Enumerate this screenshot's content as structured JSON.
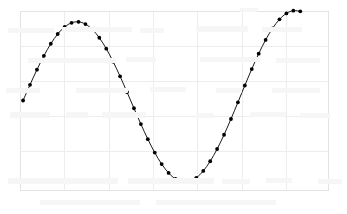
{
  "figure": {
    "background_color": "#ffffff",
    "plot_area": {
      "left": 20,
      "top": 11,
      "right": 328,
      "bottom": 190
    }
  },
  "chart_data": {
    "type": "line",
    "title": "",
    "subtitle": "",
    "xlabel": "",
    "ylabel": "",
    "legend": [],
    "annotations": [],
    "grid": {
      "visible": true,
      "color": "#ededed",
      "border_color": "#e4e4e4",
      "x_gridlines": [
        20,
        64,
        109,
        153,
        197,
        242,
        286,
        328
      ],
      "y_gridlines": [
        11,
        46,
        81,
        116,
        151,
        190
      ]
    },
    "xlim": [
      0,
      1
    ],
    "ylim": [
      -1.15,
      1.15
    ],
    "xticks": [],
    "yticks": [],
    "xtick_labels": [],
    "ytick_labels": [],
    "series": [
      {
        "name": "sine",
        "color": "#1a1a1a",
        "line_width": 1.0,
        "marker": "circle",
        "marker_size": 1.9,
        "marker_color": "#000000",
        "x": [
          0.01,
          0.0325,
          0.055,
          0.0775,
          0.1,
          0.1225,
          0.145,
          0.1675,
          0.19,
          0.2125,
          0.235,
          0.2575,
          0.28,
          0.3025,
          0.325,
          0.3475,
          0.37,
          0.3925,
          0.415,
          0.4375,
          0.46,
          0.4825,
          0.505,
          0.5275,
          0.55,
          0.5725,
          0.595,
          0.6175,
          0.64,
          0.6625,
          0.685,
          0.7075,
          0.73,
          0.7525,
          0.775,
          0.7975,
          0.82,
          0.8425,
          0.865,
          0.8875,
          0.91
        ],
        "y": [
          0.0,
          0.2019,
          0.3959,
          0.574,
          0.729,
          0.8545,
          0.9456,
          0.9983,
          1.0105,
          0.9816,
          0.9126,
          0.8061,
          0.6663,
          0.4987,
          0.31,
          0.1079,
          -0.0993,
          -0.3035,
          -0.4963,
          -0.6697,
          -0.8167,
          -0.9312,
          -1.0086,
          -1.0456,
          -1.0404,
          -0.9932,
          -0.9055,
          -0.7807,
          -0.6235,
          -0.44,
          -0.2374,
          -0.0236,
          0.193,
          0.4043,
          0.6021,
          0.7789,
          0.9277,
          1.0428,
          1.1194,
          1.1543,
          1.1455
        ]
      }
    ]
  }
}
